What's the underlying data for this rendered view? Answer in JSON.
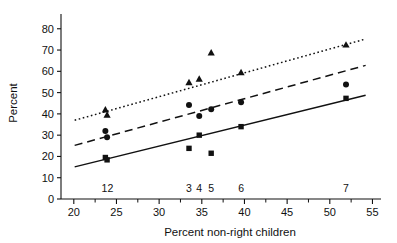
{
  "chart_data": {
    "type": "scatter",
    "title": "",
    "xlabel": "Percent non-right children",
    "ylabel": "Percent",
    "xlim": [
      18.5,
      56
    ],
    "ylim": [
      0,
      86
    ],
    "xticks": [
      20,
      25,
      30,
      35,
      40,
      45,
      50,
      55
    ],
    "xtick_labels": [
      "20",
      "25",
      "30",
      "35",
      "40",
      "45",
      "50",
      "55"
    ],
    "x_minor_ticks": [
      22.5,
      27.5,
      32.5,
      37.5,
      42.5,
      47.5,
      52.5
    ],
    "yticks": [
      0,
      10,
      20,
      30,
      40,
      50,
      60,
      70,
      80
    ],
    "ytick_labels": [
      "0",
      "10",
      "20",
      "30",
      "40",
      "50",
      "60",
      "70",
      "80"
    ],
    "grid": false,
    "legend": "none",
    "sample_labels": [
      {
        "text": "1",
        "x": 23.6
      },
      {
        "text": "2",
        "x": 24.3
      },
      {
        "text": "3",
        "x": 33.5
      },
      {
        "text": "4",
        "x": 34.7
      },
      {
        "text": "5",
        "x": 36.1
      },
      {
        "text": "6",
        "x": 39.6
      },
      {
        "text": "7",
        "x": 51.9
      }
    ],
    "sample_label_y": 5,
    "series": [
      {
        "name": "triangle",
        "marker": "triangle",
        "trend_style": "dotted",
        "points": [
          {
            "x": 23.7,
            "y": 42.0
          },
          {
            "x": 23.9,
            "y": 39.5
          },
          {
            "x": 33.5,
            "y": 54.8
          },
          {
            "x": 34.7,
            "y": 56.5
          },
          {
            "x": 36.1,
            "y": 68.8
          },
          {
            "x": 39.6,
            "y": 59.5
          },
          {
            "x": 51.9,
            "y": 72.5
          }
        ],
        "trend": {
          "x1": 20.1,
          "y1": 37.0,
          "x2": 54.2,
          "y2": 75.2
        }
      },
      {
        "name": "circle",
        "marker": "circle",
        "trend_style": "dashed",
        "points": [
          {
            "x": 23.7,
            "y": 32.0
          },
          {
            "x": 23.9,
            "y": 29.0
          },
          {
            "x": 33.5,
            "y": 44.2
          },
          {
            "x": 34.7,
            "y": 39.0
          },
          {
            "x": 36.1,
            "y": 42.2
          },
          {
            "x": 39.6,
            "y": 45.5
          },
          {
            "x": 51.9,
            "y": 53.8
          }
        ],
        "trend": {
          "x1": 20.1,
          "y1": 25.2,
          "x2": 54.2,
          "y2": 62.8
        }
      },
      {
        "name": "square",
        "marker": "square",
        "trend_style": "solid",
        "points": [
          {
            "x": 23.7,
            "y": 19.5
          },
          {
            "x": 23.9,
            "y": 18.4
          },
          {
            "x": 33.5,
            "y": 23.8
          },
          {
            "x": 34.7,
            "y": 30.0
          },
          {
            "x": 36.1,
            "y": 21.5
          },
          {
            "x": 39.6,
            "y": 34.0
          },
          {
            "x": 51.9,
            "y": 47.3
          }
        ],
        "trend": {
          "x1": 20.1,
          "y1": 15.1,
          "x2": 54.2,
          "y2": 48.8
        }
      }
    ]
  },
  "colors": {
    "ink": "#111111",
    "background": "#ffffff"
  }
}
